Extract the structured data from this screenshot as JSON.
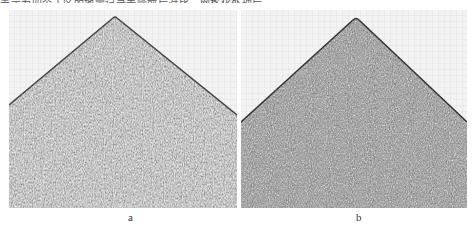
{
  "header": {
    "cut_text": "表示为四个工区的地震记录去噪前后对比，网格化处理后……"
  },
  "figure": {
    "panels": [
      {
        "label": "a",
        "description": "seismic shot record (before)",
        "apex_x_frac": 0.46
      },
      {
        "label": "b",
        "description": "seismic shot record (after)",
        "apex_x_frac": 0.51
      }
    ],
    "colors": {
      "background": "#f2f2f2",
      "noise_dark": "#555555",
      "noise_light": "#bbbbbb",
      "grid": "#d0d0d0"
    }
  }
}
